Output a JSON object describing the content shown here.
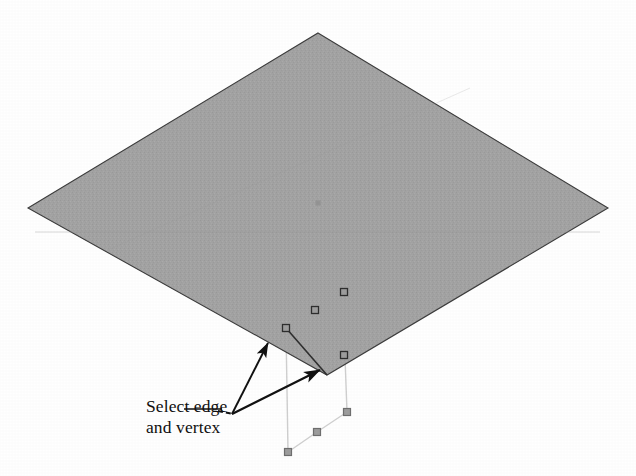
{
  "figure": {
    "background_color": "#ffffff",
    "annotation": {
      "line1": "Select edge",
      "line2": "and vertex",
      "text_color": "#100f0f",
      "leader_origin": {
        "x": 232,
        "y": 414
      },
      "leader_dash_start": {
        "x": 218,
        "y": 411
      },
      "leader_dash_end": {
        "x": 232,
        "y": 414
      }
    },
    "surface": {
      "name": "isometric-plane",
      "fill_color": "#a3a3a3",
      "edge_color": "#3c3c3c",
      "points": [
        {
          "x": 318,
          "y": 33
        },
        {
          "x": 608,
          "y": 208
        },
        {
          "x": 327,
          "y": 375
        },
        {
          "x": 28,
          "y": 208
        }
      ],
      "center_mark": {
        "x": 318,
        "y": 203
      }
    },
    "vertex_markers": [
      {
        "name": "surface-vertex-1",
        "x": 344,
        "y": 292
      },
      {
        "name": "surface-vertex-2",
        "x": 315,
        "y": 310
      },
      {
        "name": "surface-vertex-3",
        "x": 286,
        "y": 328
      },
      {
        "name": "surface-corner-vertex",
        "x": 344,
        "y": 355
      },
      {
        "name": "lower-vertex-left",
        "x": 288,
        "y": 452
      },
      {
        "name": "lower-vertex-mid",
        "x": 317,
        "y": 432
      },
      {
        "name": "lower-vertex-right",
        "x": 347,
        "y": 412
      }
    ],
    "marker_style": {
      "size": 7,
      "stroke_color": "#2e2e2e",
      "fill_color": "#9d9d9d"
    },
    "construction_lines": {
      "color": "#cfcfcf",
      "segments": [
        {
          "name": "drop-line-left",
          "x1": 286,
          "y1": 330,
          "x2": 288,
          "y2": 452
        },
        {
          "name": "drop-line-right",
          "x1": 345,
          "y1": 357,
          "x2": 347,
          "y2": 412
        },
        {
          "name": "lower-edge-left",
          "x1": 288,
          "y1": 452,
          "x2": 317,
          "y2": 432
        },
        {
          "name": "lower-edge-right",
          "x1": 317,
          "y1": 432,
          "x2": 347,
          "y2": 412
        }
      ]
    },
    "arrows": [
      {
        "name": "arrow-to-edge",
        "x1": 232,
        "y1": 414,
        "x2": 268,
        "y2": 343,
        "color": "#111111"
      },
      {
        "name": "arrow-to-vertex",
        "x1": 232,
        "y1": 414,
        "x2": 320,
        "y2": 370,
        "color": "#111111"
      }
    ]
  }
}
